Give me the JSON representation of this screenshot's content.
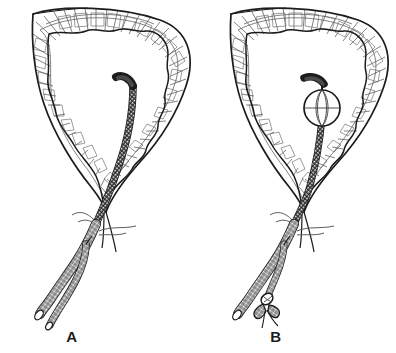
{
  "figure": {
    "type": "line-art anatomical illustration",
    "background_color": "#ffffff",
    "ink_color": "#1c1c1c",
    "wall_hatch_color": "#555555",
    "width": 396,
    "height": 353,
    "panel_count": 2
  },
  "panels": [
    {
      "id": "panel-a",
      "label": "A",
      "label_x": 72,
      "label_y": 342,
      "caption_state": "balloon deflated, catheter tip within bladder lumen",
      "structures": {
        "bladder_outer_wall": "teardrop/heart shaped outer contour",
        "bladder_inner_lumen": "irregular scalloped inner mucosal outline",
        "muscular_wall_texture": "radiating brick-like hatch cells between outer and inner contours",
        "urethra": "tapering channel descending from bladder neck",
        "catheter_tip": "dark rounded eye-tip resting in lumen",
        "catheter_shaft": "cross-hatched tube running through urethra",
        "drainage_limb": "longer cross-hatched limb, open cut end",
        "inflation_limb": "shorter side limb, open untied end",
        "meatus_wisps": "fine free-hand tissue wisps at catheter exit point"
      }
    },
    {
      "id": "panel-b",
      "label": "B",
      "label_x": 276,
      "label_y": 342,
      "caption_state": "balloon inflated at bladder neck, inflation limb tied off",
      "structures": {
        "bladder_outer_wall": "teardrop/heart shaped outer contour",
        "bladder_inner_lumen": "irregular scalloped inner mucosal outline",
        "muscular_wall_texture": "radiating brick-like hatch cells between outer and inner contours",
        "urethra": "tapering channel descending from bladder neck",
        "catheter_tip": "dark stubby tip above the balloon",
        "balloon": "inflated spherical retention balloon with meridian lines",
        "catheter_shaft": "cross-hatched tube running through urethra",
        "drainage_limb": "longer cross-hatched limb, open cut end",
        "inflation_limb": "shorter side limb finished with a tied knot",
        "knot": "bow/knot tie closing the inflation limb",
        "meatus_wisps": "fine free-hand tissue wisps at catheter exit point"
      }
    }
  ]
}
